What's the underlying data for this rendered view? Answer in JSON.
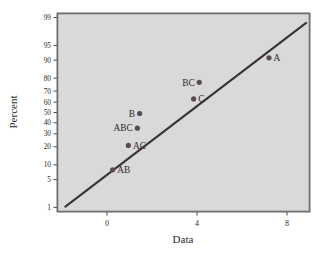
{
  "chart_data": {
    "type": "scatter",
    "title": "",
    "subtitle": "",
    "xlabel": "Data",
    "ylabel": "Percent",
    "scale": "normal-probability",
    "grid": true,
    "legend": "none",
    "xlim": [
      -2.2,
      9.0
    ],
    "xticks": [
      0,
      4,
      8
    ],
    "xticklabels": [
      "0",
      "4",
      "8"
    ],
    "yticks": [
      1,
      5,
      10,
      20,
      30,
      40,
      50,
      60,
      70,
      80,
      90,
      95,
      99
    ],
    "yticklabels": [
      "1",
      "5",
      "10",
      "20",
      "30",
      "40",
      "50",
      "60",
      "70",
      "80",
      "90",
      "95",
      "99"
    ],
    "ylim": [
      1,
      99
    ],
    "points": [
      {
        "label": "AB",
        "x": 0.25,
        "y": 8,
        "label_pos": "right"
      },
      {
        "label": "AC",
        "x": 0.95,
        "y": 21,
        "label_pos": "right"
      },
      {
        "label": "ABC",
        "x": 1.35,
        "y": 35,
        "label_pos": "left"
      },
      {
        "label": "B",
        "x": 1.45,
        "y": 49,
        "label_pos": "left"
      },
      {
        "label": "C",
        "x": 3.85,
        "y": 63,
        "label_pos": "right"
      },
      {
        "label": "BC",
        "x": 4.1,
        "y": 77,
        "label_pos": "left"
      },
      {
        "label": "A",
        "x": 7.2,
        "y": 91,
        "label_pos": "right"
      }
    ],
    "fit_line": {
      "x_start": -1.85,
      "y_start": 1.05,
      "x_end": 8.85,
      "y_end": 98.6
    },
    "colors": {
      "plot_background": "#d9d9d9",
      "page_background": "#ffffff",
      "point": "#5c4a52",
      "line": "#3a3238",
      "grid": "#9a9a9a",
      "frame": "#6e6e6e",
      "text": "#2b2b2b"
    }
  }
}
